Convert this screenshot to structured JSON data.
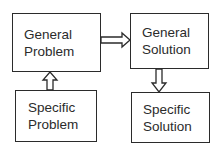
{
  "diagram": {
    "nodes": [
      {
        "id": "general-problem",
        "line1": "General",
        "line2": "Problem"
      },
      {
        "id": "general-solution",
        "line1": "General",
        "line2": "Solution"
      },
      {
        "id": "specific-problem",
        "line1": "Specific",
        "line2": "Problem"
      },
      {
        "id": "specific-solution",
        "line1": "Specific",
        "line2": "Solution"
      }
    ],
    "edges": [
      {
        "from": "specific-problem",
        "to": "general-problem",
        "style": "hollow-double-arrow"
      },
      {
        "from": "general-problem",
        "to": "general-solution",
        "style": "hollow-double-arrow"
      },
      {
        "from": "general-solution",
        "to": "specific-solution",
        "style": "hollow-double-arrow"
      }
    ]
  }
}
